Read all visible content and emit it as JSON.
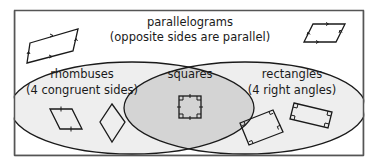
{
  "diagram": {
    "type": "venn",
    "universe": {
      "title": "parallelograms",
      "subtitle": "(opposite sides are parallel)"
    },
    "sets": [
      {
        "id": "rhombuses",
        "title": "rhombuses",
        "subtitle": "(4 congruent sides)"
      },
      {
        "id": "rectangles",
        "title": "rectangles",
        "subtitle": "(4 right angles)"
      }
    ],
    "intersection": {
      "title": "squares"
    },
    "colors": {
      "frame": "#555555",
      "circle_fill": "#eeeeee",
      "intersection_fill": "#d4d4d4",
      "stroke": "#1a1a1a",
      "text": "#1a1a1a"
    },
    "example_shapes": [
      {
        "region": "parallelograms",
        "shape": "parallelogram",
        "count": 2,
        "marks": "parallel-arrows"
      },
      {
        "region": "rhombuses",
        "shape": "rhombus",
        "count": 2,
        "marks": "congruent-ticks"
      },
      {
        "region": "squares",
        "shape": "square",
        "count": 1,
        "marks": "right-angles-and-ticks"
      },
      {
        "region": "rectangles",
        "shape": "rectangle",
        "count": 2,
        "marks": "right-angles"
      }
    ]
  }
}
